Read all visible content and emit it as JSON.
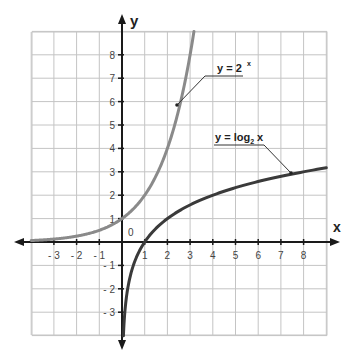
{
  "chart_data": {
    "type": "line",
    "title": "",
    "xlabel": "x",
    "ylabel": "y",
    "origin_label": "0",
    "xlim": [
      -4,
      9
    ],
    "ylim": [
      -4,
      9
    ],
    "grid": true,
    "x_ticks": [
      -3,
      -2,
      -1,
      1,
      2,
      3,
      4,
      5,
      6,
      7,
      8
    ],
    "y_ticks": [
      -3,
      -2,
      -1,
      1,
      2,
      3,
      4,
      5,
      6,
      7,
      8
    ],
    "series": [
      {
        "name": "y = 2^x",
        "label_main": "y = 2",
        "label_sup": "x",
        "color": "#8a8a8a",
        "function": "exp2",
        "x": [
          -4,
          -3,
          -2,
          -1,
          0,
          1,
          2,
          2.5,
          3,
          3.17
        ],
        "y": [
          0.0625,
          0.125,
          0.25,
          0.5,
          1,
          2,
          4,
          5.66,
          8,
          9
        ],
        "callout_point": [
          2.5,
          5.9
        ],
        "label_position": [
          4.5,
          7.1
        ]
      },
      {
        "name": "y = log2 x",
        "label_main": "y = log",
        "label_sub": "2",
        "label_tail": " x",
        "color": "#3a3a3a",
        "function": "log2",
        "x": [
          0.06,
          0.125,
          0.25,
          0.5,
          1,
          2,
          4,
          7.5,
          9
        ],
        "y": [
          -4,
          -3,
          -2,
          -1,
          0,
          1,
          2,
          2.9,
          3.17
        ],
        "callout_point": [
          7.5,
          2.9
        ],
        "label_position": [
          3.5,
          4.0
        ]
      }
    ]
  }
}
